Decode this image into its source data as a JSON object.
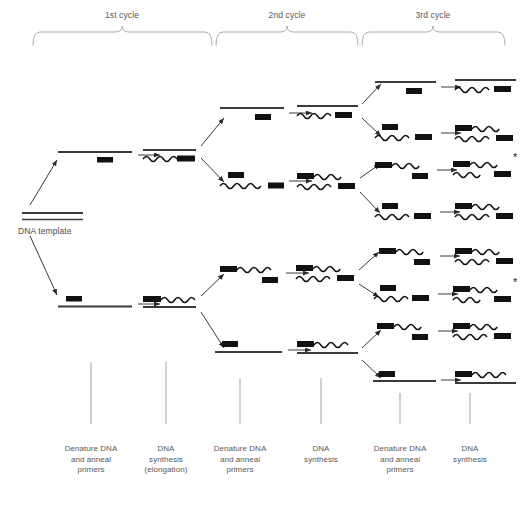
{
  "figure": {
    "background": "#ffffff",
    "width": 527,
    "height": 515
  },
  "colors": {
    "ink": "#1a1a1a",
    "strand": "#3a3a3a",
    "text": "#58585a",
    "bracket": "#9a9a9a",
    "tick": "#8c8c8c",
    "arrow": "#2b2b2b"
  },
  "cycles": [
    {
      "id": "cycle-1",
      "label": "1st cycle",
      "x0": 33,
      "x1": 212,
      "label_x": 122,
      "label_y": 14
    },
    {
      "id": "cycle-2",
      "label": "2nd cycle",
      "x0": 216,
      "x1": 358,
      "label_x": 287,
      "label_y": 14
    },
    {
      "id": "cycle-3",
      "label": "3rd cycle",
      "x0": 362,
      "x1": 505,
      "label_x": 433,
      "label_y": 14
    }
  ],
  "columns": [
    {
      "id": "col-denature-1",
      "lines": [
        "Denature DNA",
        "and anneal",
        "primers"
      ],
      "tick_x": 91,
      "tick_y0": 362,
      "tick_y1": 424,
      "label_y": 449
    },
    {
      "id": "col-synthesis-1",
      "lines": [
        "DNA",
        "synthesis",
        "(elongation)"
      ],
      "tick_x": 166,
      "tick_y0": 362,
      "tick_y1": 424,
      "label_y": 449
    },
    {
      "id": "col-denature-2",
      "lines": [
        "Denature DNA",
        "and anneal",
        "primers"
      ],
      "tick_x": 240,
      "tick_y0": 378,
      "tick_y1": 424,
      "label_y": 449
    },
    {
      "id": "col-synthesis-2",
      "lines": [
        "DNA",
        "synthesis"
      ],
      "tick_x": 321,
      "tick_y0": 378,
      "tick_y1": 424,
      "label_y": 449
    },
    {
      "id": "col-denature-3",
      "lines": [
        "Denature DNA",
        "and anneal",
        "primers"
      ],
      "tick_x": 400,
      "tick_y0": 393,
      "tick_y1": 424,
      "label_y": 449
    },
    {
      "id": "col-synthesis-3",
      "lines": [
        "DNA",
        "synthesis"
      ],
      "tick_x": 470,
      "tick_y0": 393,
      "tick_y1": 424,
      "label_y": 449
    }
  ],
  "template": {
    "label": "DNA template",
    "label_x": 20,
    "label_y": 232,
    "x0": 22,
    "x1": 83,
    "y_top": 213,
    "y_bottom": 221
  },
  "legend_markers": {
    "primer_block": "solid black rectangle = primer / primer-derived sequence",
    "straight_line": "original template strand",
    "wavy_line": "newly synthesised DNA strand",
    "asterisk": "target-length amplicon of defined length"
  },
  "asterisks": [
    {
      "id": "asterisk-upper",
      "symbol": "*",
      "x": 509,
      "y": 156
    },
    {
      "id": "asterisk-lower",
      "symbol": "*",
      "x": 509,
      "y": 281
    }
  ],
  "molecules": {
    "cycle1_denature": [
      {
        "id": "c1d-top",
        "y": 152,
        "x0": 58,
        "x1": 132,
        "top": {
          "kind": "straight"
        },
        "primer": {
          "side": "bottom",
          "x": 97,
          "w": 15
        }
      },
      {
        "id": "c1d-bottom",
        "y": 305,
        "x0": 58,
        "x1": 132,
        "top": {
          "kind": "straight"
        },
        "primer": {
          "side": "top",
          "x": 66,
          "w": 15
        }
      }
    ],
    "cycle1_synthesis": [
      {
        "id": "c1s-top",
        "y": 152,
        "x0": 139,
        "x1": 196,
        "strand": "straight-top-wavy-bottom",
        "primer_x": 176
      },
      {
        "id": "c1s-bottom",
        "y": 305,
        "x0": 139,
        "x1": 196,
        "strand": "wavy-top-straight-bottom",
        "primer_x": 142
      }
    ],
    "cycle2_denature": [
      {
        "id": "c2d-1",
        "y": 112,
        "kind": "straight-with-primer-below"
      },
      {
        "id": "c2d-2",
        "y": 180,
        "kind": "wavy-with-primer-above"
      },
      {
        "id": "c2d-3",
        "y": 272,
        "kind": "wavy-with-primer-below"
      },
      {
        "id": "c2d-4",
        "y": 350,
        "kind": "straight-with-primer-above"
      }
    ],
    "cycle2_synthesis": [
      {
        "id": "c2s-1",
        "y": 112
      },
      {
        "id": "c2s-2",
        "y": 180
      },
      {
        "id": "c2s-3",
        "y": 272
      },
      {
        "id": "c2s-4",
        "y": 350
      }
    ],
    "cycle3_denature": [
      {
        "id": "c3d-1",
        "y": 88
      },
      {
        "id": "c3d-2",
        "y": 132
      },
      {
        "id": "c3d-3",
        "y": 168
      },
      {
        "id": "c3d-4",
        "y": 210
      },
      {
        "id": "c3d-5",
        "y": 255
      },
      {
        "id": "c3d-6",
        "y": 293
      },
      {
        "id": "c3d-7",
        "y": 330
      },
      {
        "id": "c3d-8",
        "y": 377
      }
    ],
    "cycle3_synthesis": [
      {
        "id": "c3s-1",
        "y": 88
      },
      {
        "id": "c3s-2",
        "y": 132
      },
      {
        "id": "c3s-3",
        "y": 168,
        "asterisk": true
      },
      {
        "id": "c3s-4",
        "y": 210
      },
      {
        "id": "c3s-5",
        "y": 255
      },
      {
        "id": "c3s-6",
        "y": 293,
        "asterisk": true
      },
      {
        "id": "c3s-7",
        "y": 330
      },
      {
        "id": "c3s-8",
        "y": 377
      }
    ]
  }
}
